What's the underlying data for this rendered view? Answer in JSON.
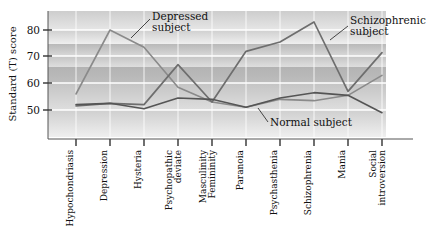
{
  "chart_data": {
    "type": "line",
    "title": "",
    "xlabel": "",
    "ylabel": "Standard (T) score",
    "ylim": [
      40,
      87
    ],
    "yticks": [
      50,
      60,
      70,
      80
    ],
    "grid": true,
    "legend_position": "inline-annotations",
    "categories": [
      "Hypochondriasis",
      "Depression",
      "Hysteria",
      "Psychopathic deviate",
      "Masculinity Femininity",
      "Paranoia",
      "Psychasthenia",
      "Schizophrenia",
      "Mania",
      "Social introversion"
    ],
    "category_lines": [
      [
        "Hypochondriasis"
      ],
      [
        "Depression"
      ],
      [
        "Hysteria"
      ],
      [
        "Psychopathic",
        "deviate"
      ],
      [
        "Masculinity",
        "Femininity"
      ],
      [
        "Paranoia"
      ],
      [
        "Psychasthenia"
      ],
      [
        "Schizophrenia"
      ],
      [
        "Mania"
      ],
      [
        "Social",
        "introversion"
      ]
    ],
    "series": [
      {
        "name": "Depressed subject",
        "color": "#8a8a8a",
        "values": [
          56,
          80,
          73.5,
          58.5,
          53,
          51,
          54,
          53.5,
          55.5,
          63
        ]
      },
      {
        "name": "Schizophrenic subject",
        "color": "#6e6e6e",
        "values": [
          51.5,
          52.5,
          52,
          67,
          53,
          72,
          75.5,
          83,
          57,
          71.5
        ]
      },
      {
        "name": "Normal subject",
        "color": "#555555",
        "values": [
          52,
          52.5,
          50.5,
          54.5,
          54,
          51,
          54.5,
          56.5,
          55.5,
          49
        ]
      }
    ],
    "annotations": [
      {
        "name": "depressed-subject-label",
        "lines": [
          "Depressed",
          "subject"
        ]
      },
      {
        "name": "schizophrenic-subject-label",
        "lines": [
          "Schizophrenic",
          "subject"
        ]
      },
      {
        "name": "normal-subject-label",
        "lines": [
          "Normal subject"
        ]
      }
    ]
  },
  "axis": {
    "y_label": "Standard (T) score",
    "tick_50": "50",
    "tick_60": "60",
    "tick_70": "70",
    "tick_80": "80"
  },
  "annotations": {
    "depressed_line1": "Depressed",
    "depressed_line2": "subject",
    "schizophrenic_line1": "Schizophrenic",
    "schizophrenic_line2": "subject",
    "normal_line1": "Normal subject"
  },
  "categories": {
    "c0_l1": "Hypochondriasis",
    "c1_l1": "Depression",
    "c2_l1": "Hysteria",
    "c3_l1": "Psychopathic",
    "c3_l2": "deviate",
    "c4_l1": "Masculinity",
    "c4_l2": "Femininity",
    "c5_l1": "Paranoia",
    "c6_l1": "Psychasthenia",
    "c7_l1": "Schizophrenia",
    "c8_l1": "Mania",
    "c9_l1": "Social",
    "c9_l2": "introversion"
  }
}
